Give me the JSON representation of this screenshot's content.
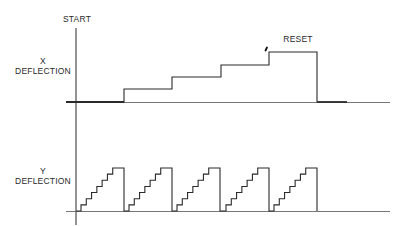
{
  "labels": {
    "start": "START",
    "x_deflection_line1": "X",
    "x_deflection_line2": "DEFLECTION",
    "reset": "RESET",
    "y_deflection_line1": "Y",
    "y_deflection_line2": "DEFLECTION"
  },
  "colors": {
    "line": "#2a2a2a",
    "baseline": "#555555",
    "background": "#ffffff"
  },
  "x_waveform": {
    "description": "Staircase X deflection: 4 steps then reset",
    "baseline_y": 102,
    "steps": [
      {
        "x_start": 76,
        "x_end": 124,
        "level": 102
      },
      {
        "x_start": 124,
        "x_end": 172,
        "level": 89
      },
      {
        "x_start": 172,
        "x_end": 221,
        "level": 77
      },
      {
        "x_start": 221,
        "x_end": 269,
        "level": 65
      },
      {
        "x_start": 269,
        "x_end": 317,
        "level": 52
      }
    ],
    "reset_x": 317
  },
  "y_waveform": {
    "description": "Repeating staircase sawtooth Y deflection, 5 cycles",
    "baseline_y": 211,
    "cycles": 5,
    "cycle_start_x": [
      76,
      124,
      172,
      221,
      269
    ],
    "period": 48,
    "steps_per_cycle": 7,
    "top_y": 168
  }
}
